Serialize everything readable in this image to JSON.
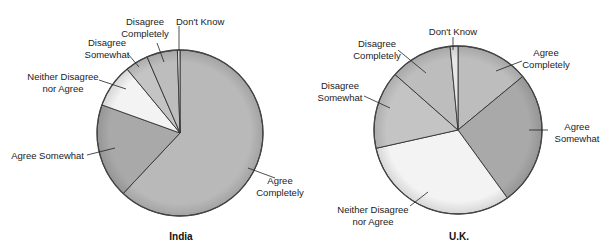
{
  "chart_data": [
    {
      "type": "pie",
      "title": "India",
      "categories": [
        "Agree Completely",
        "Agree Somewhat",
        "Neither Disagree nor Agree",
        "Disagree Somewhat",
        "Disagree Completely",
        "Don't Know"
      ],
      "values": [
        62,
        18.5,
        8.5,
        4.5,
        6,
        0.5
      ],
      "unit": "percent (estimated from slice angles)",
      "start_angle_deg": 0,
      "direction": "clockwise",
      "colors": [
        "#b9b9b9",
        "#a9a9a9",
        "#f3f3f3",
        "#c4c4c4",
        "#bdbdbd",
        "#e6e6e6"
      ],
      "legend": "none (leader-line labels)"
    },
    {
      "type": "pie",
      "title": "U.K.",
      "categories": [
        "Agree Completely",
        "Agree Somewhat",
        "Neither Disagree nor Agree",
        "Disagree Somewhat",
        "Disagree Completely",
        "Don't Know"
      ],
      "values": [
        14,
        26,
        31.5,
        15,
        12,
        1.5
      ],
      "unit": "percent (estimated from slice angles)",
      "start_angle_deg": 0,
      "direction": "clockwise",
      "colors": [
        "#bdbdbd",
        "#a9a9a9",
        "#f3f3f3",
        "#c4c4c4",
        "#bdbdbd",
        "#e6e6e6"
      ],
      "legend": "none (leader-line labels)"
    }
  ],
  "labels": {
    "india": {
      "title": "India",
      "agree_completely_1": "Agree",
      "agree_completely_2": "Completely",
      "agree_somewhat": "Agree Somewhat",
      "neither_1": "Neither Disagree",
      "neither_2": "nor Agree",
      "disagree_somewhat_1": "Disagree",
      "disagree_somewhat_2": "Somewhat",
      "disagree_completely_1": "Disagree",
      "disagree_completely_2": "Completely",
      "dont_know": "Don't Know"
    },
    "uk": {
      "title": "U.K.",
      "agree_completely_1": "Agree",
      "agree_completely_2": "Completely",
      "agree_somewhat_1": "Agree",
      "agree_somewhat_2": "Somewhat",
      "neither_1": "Neither Disagree",
      "neither_2": "nor Agree",
      "disagree_somewhat_1": "Disagree",
      "disagree_somewhat_2": "Somewhat",
      "disagree_completely_1": "Disagree",
      "disagree_completely_2": "Completely",
      "dont_know": "Don't Know"
    }
  }
}
